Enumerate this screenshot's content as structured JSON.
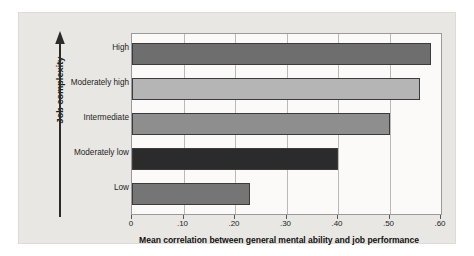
{
  "chart_data": {
    "type": "bar",
    "orientation": "horizontal",
    "title": "",
    "xlabel": "Mean correlation between general mental ability and job performance",
    "ylabel": "Job complexity",
    "categories": [
      "High",
      "Moderately high",
      "Intermediate",
      "Moderately low",
      "Low"
    ],
    "values": [
      0.58,
      0.56,
      0.5,
      0.4,
      0.23
    ],
    "series": [
      {
        "name": "Mean correlation",
        "values": [
          0.58,
          0.56,
          0.5,
          0.4,
          0.23
        ]
      }
    ],
    "bar_colors": [
      "#6e6e6e",
      "#b5b5b5",
      "#8e8e8e",
      "#2b2b2b",
      "#757575"
    ],
    "xlim": [
      0,
      0.6
    ],
    "xticks": [
      0,
      0.1,
      0.2,
      0.3,
      0.4,
      0.5,
      0.6
    ],
    "xticklabels": [
      "0",
      ".10",
      ".20",
      ".30",
      ".40",
      ".50",
      ".60"
    ],
    "grid": "vertical",
    "legend": "none",
    "y_axis_arrow": "upward"
  },
  "axes": {
    "y_title": "Job complexity",
    "x_title": "Mean correlation between general mental ability and job performance"
  },
  "colors": {
    "page_background": "#e9e7e3",
    "plot_background": "#fbfaf8",
    "gridline": "#b9b9b9",
    "axis_border": "#9a9a9a",
    "text": "#1d1d1d"
  }
}
